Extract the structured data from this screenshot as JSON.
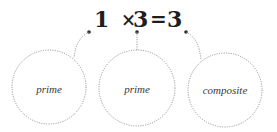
{
  "equation": {
    "term1": "1",
    "operator": "×",
    "term2": "3",
    "equals": "=",
    "result": "3"
  },
  "circles": [
    {
      "label": "prime",
      "points_to": "1"
    },
    {
      "label": "prime",
      "points_to": "3"
    },
    {
      "label": "composite",
      "points_to": "3"
    }
  ],
  "colors": {
    "text": "#1e1e1e",
    "label": "#3a3a3a",
    "dotted_line": "#8a8a8a",
    "background": "#ffffff"
  }
}
